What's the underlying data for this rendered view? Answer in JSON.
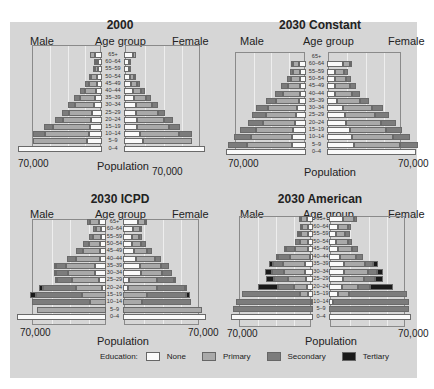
{
  "legend": {
    "title": "Education:",
    "items": [
      {
        "key": "none",
        "label": "None",
        "color": "#fafafa"
      },
      {
        "key": "primary",
        "label": "Primary",
        "color": "#a9a9a9"
      },
      {
        "key": "secondary",
        "label": "Secondary",
        "color": "#7c7c7c"
      },
      {
        "key": "tertiary",
        "label": "Tertiary",
        "color": "#1a1a1a"
      }
    ]
  },
  "age_groups": [
    "65+",
    "60–64",
    "55–59",
    "50–54",
    "45–49",
    "40–44",
    "35–39",
    "30–34",
    "25–29",
    "20–24",
    "15–19",
    "10–14",
    "5–9",
    "0–4"
  ],
  "panels": [
    {
      "title": "2000",
      "male_label": "Male",
      "female_label": "Female",
      "age_label": "Age group",
      "x_label": "Population",
      "left_tick": "70,000",
      "right_tick": "70,000"
    },
    {
      "title": "2030 Constant",
      "male_label": "Male",
      "female_label": "Female",
      "age_label": "Age group",
      "x_label": "Population",
      "left_tick": "70,000",
      "right_tick": "70,000"
    },
    {
      "title": "2030 ICPD",
      "male_label": "Male",
      "female_label": "Female",
      "age_label": "Age group",
      "x_label": "Population",
      "left_tick": "70,000",
      "right_tick": "70,000"
    },
    {
      "title": "2030 American",
      "male_label": "Male",
      "female_label": "Female",
      "age_label": "Age group",
      "x_label": "Population",
      "left_tick": "70,000",
      "right_tick": "70,000"
    }
  ],
  "chart_data": [
    {
      "type": "bar",
      "title": "2000",
      "xlabel": "Population",
      "ylabel": "Age group",
      "xlim": [
        -70000,
        70000
      ],
      "categories": [
        "65+",
        "60–64",
        "55–59",
        "50–54",
        "45–49",
        "40–44",
        "35–39",
        "30–34",
        "25–29",
        "20–24",
        "15–19",
        "10–14",
        "5–9",
        "0–4"
      ],
      "series": [
        {
          "name": "Male None",
          "values": [
            6000,
            3000,
            3000,
            4000,
            4000,
            5000,
            6000,
            7000,
            8000,
            9000,
            10000,
            11000,
            12000,
            69000
          ]
        },
        {
          "name": "Male Primary",
          "values": [
            4000,
            2000,
            3000,
            5000,
            7000,
            9000,
            12000,
            15000,
            19000,
            23000,
            30000,
            36000,
            45000,
            0
          ]
        },
        {
          "name": "Male Secondary",
          "values": [
            0,
            1000,
            1000,
            2000,
            3000,
            4000,
            5000,
            6000,
            6000,
            7000,
            8000,
            10000,
            0,
            0
          ]
        },
        {
          "name": "Male Tertiary",
          "values": [
            0,
            0,
            0,
            0,
            0,
            0,
            0,
            0,
            0,
            0,
            0,
            0,
            0,
            0
          ]
        },
        {
          "name": "Female None",
          "values": [
            7000,
            4000,
            4000,
            5000,
            6000,
            7000,
            8000,
            10000,
            10000,
            11000,
            11000,
            13000,
            16000,
            67000
          ]
        },
        {
          "name": "Female Primary",
          "values": [
            3000,
            1000,
            2000,
            3000,
            5000,
            7000,
            10000,
            13000,
            18000,
            22000,
            26000,
            32000,
            40000,
            0
          ]
        },
        {
          "name": "Female Secondary",
          "values": [
            0,
            0,
            0,
            1000,
            2000,
            3000,
            4000,
            5000,
            6000,
            7000,
            9000,
            11000,
            0,
            0
          ]
        },
        {
          "name": "Female Tertiary",
          "values": [
            0,
            0,
            0,
            0,
            0,
            0,
            0,
            0,
            0,
            0,
            0,
            0,
            0,
            0
          ]
        }
      ],
      "legend": [
        "None",
        "Primary",
        "Secondary",
        "Tertiary"
      ],
      "grid": true
    },
    {
      "type": "bar",
      "title": "2030 Constant",
      "xlabel": "Population",
      "ylabel": "Age group",
      "xlim": [
        -70000,
        70000
      ],
      "categories": [
        "65+",
        "60–64",
        "55–59",
        "50–54",
        "45–49",
        "40–44",
        "35–39",
        "30–34",
        "25–29",
        "20–24",
        "15–19",
        "10–14",
        "5–9",
        "0–4"
      ],
      "series": [
        {
          "name": "Male None",
          "values": [
            0,
            6000,
            5000,
            5000,
            5000,
            5000,
            6000,
            8000,
            9000,
            10000,
            11000,
            12000,
            12000,
            70000
          ]
        },
        {
          "name": "Male Primary",
          "values": [
            0,
            5000,
            6000,
            8000,
            11000,
            15000,
            20000,
            25000,
            26000,
            28000,
            33000,
            36000,
            40000,
            0
          ]
        },
        {
          "name": "Male Secondary",
          "values": [
            0,
            2000,
            3000,
            4000,
            6000,
            7000,
            9000,
            11000,
            12000,
            13000,
            14000,
            15000,
            16000,
            0
          ]
        },
        {
          "name": "Male Tertiary",
          "values": [
            0,
            0,
            0,
            0,
            0,
            0,
            0,
            0,
            0,
            0,
            0,
            0,
            0,
            0
          ]
        },
        {
          "name": "Female None",
          "values": [
            0,
            14000,
            7000,
            7000,
            7000,
            7000,
            9000,
            14000,
            16000,
            17000,
            20000,
            22000,
            24000,
            78000
          ]
        },
        {
          "name": "Female Primary",
          "values": [
            0,
            6000,
            8000,
            10000,
            13000,
            15000,
            20000,
            25000,
            26000,
            30000,
            32000,
            36000,
            40000,
            0
          ]
        },
        {
          "name": "Female Secondary",
          "values": [
            0,
            2000,
            3000,
            4000,
            5000,
            7000,
            8000,
            10000,
            12000,
            13000,
            14000,
            15000,
            16000,
            0
          ]
        },
        {
          "name": "Female Tertiary",
          "values": [
            0,
            0,
            0,
            0,
            0,
            0,
            0,
            0,
            0,
            0,
            0,
            0,
            0,
            0
          ]
        }
      ],
      "legend": [
        "None",
        "Primary",
        "Secondary",
        "Tertiary"
      ],
      "grid": true
    },
    {
      "type": "bar",
      "title": "2030 ICPD",
      "xlabel": "Population",
      "ylabel": "Age group",
      "xlim": [
        -70000,
        70000
      ],
      "categories": [
        "65+",
        "60–64",
        "55–59",
        "50–54",
        "45–49",
        "40–44",
        "35–39",
        "30–34",
        "25–29",
        "20–24",
        "15–19",
        "10–14",
        "5–9",
        "0–4"
      ],
      "series": [
        {
          "name": "Male None",
          "values": [
            6000,
            4000,
            4000,
            5000,
            5000,
            5000,
            9000,
            9000,
            6000,
            3000,
            0,
            0,
            0,
            73000
          ]
        },
        {
          "name": "Male Primary",
          "values": [
            7000,
            4000,
            7000,
            9000,
            14000,
            20000,
            24000,
            22000,
            22000,
            22000,
            20000,
            13000,
            57000,
            0
          ]
        },
        {
          "name": "Male Secondary",
          "values": [
            3000,
            3000,
            3000,
            5000,
            6000,
            7000,
            8000,
            10000,
            12000,
            27000,
            38000,
            48000,
            0,
            0
          ]
        },
        {
          "name": "Male Tertiary",
          "values": [
            0,
            0,
            0,
            0,
            0,
            0,
            1000,
            1000,
            2000,
            3000,
            5000,
            0,
            0,
            0
          ]
        },
        {
          "name": "Female None",
          "values": [
            12000,
            8000,
            7000,
            7000,
            9000,
            11000,
            14000,
            15000,
            5000,
            4000,
            0,
            0,
            0,
            68000
          ]
        },
        {
          "name": "Female Primary",
          "values": [
            6000,
            6000,
            6000,
            8000,
            11000,
            15000,
            17000,
            17000,
            23000,
            24000,
            20000,
            16000,
            65000,
            0
          ]
        },
        {
          "name": "Female Secondary",
          "values": [
            2000,
            2000,
            3000,
            4000,
            4000,
            5000,
            7000,
            8000,
            14000,
            23000,
            32000,
            40000,
            0,
            0
          ]
        },
        {
          "name": "Female Tertiary",
          "values": [
            0,
            0,
            0,
            0,
            0,
            0,
            0,
            0,
            1000,
            2000,
            3000,
            0,
            0,
            0
          ]
        }
      ],
      "legend": [
        "None",
        "Primary",
        "Secondary",
        "Tertiary"
      ],
      "grid": true
    },
    {
      "type": "bar",
      "title": "2030 American",
      "xlabel": "Population",
      "ylabel": "Age group",
      "xlim": [
        -70000,
        70000
      ],
      "categories": [
        "65+",
        "60–64",
        "55–59",
        "50–54",
        "45–49",
        "40–44",
        "35–39",
        "30–34",
        "25–29",
        "20–24",
        "15–19",
        "10–14",
        "5–9",
        "0–4"
      ],
      "series": [
        {
          "name": "Male None",
          "values": [
            5000,
            4000,
            4000,
            4000,
            4000,
            3000,
            7000,
            7000,
            6000,
            5000,
            4000,
            2000,
            0,
            70000
          ]
        },
        {
          "name": "Male Primary",
          "values": [
            5000,
            5000,
            6000,
            7000,
            11000,
            17000,
            19000,
            18000,
            15000,
            11000,
            7000,
            0,
            0,
            0
          ]
        },
        {
          "name": "Male Secondary",
          "values": [
            2000,
            2000,
            2000,
            4000,
            8000,
            10000,
            8000,
            10000,
            12000,
            14000,
            50000,
            64000,
            68000,
            0
          ]
        },
        {
          "name": "Male Tertiary",
          "values": [
            0,
            0,
            1000,
            0,
            1000,
            2000,
            4000,
            6000,
            7000,
            17000,
            0,
            0,
            0,
            0
          ]
        },
        {
          "name": "Female None",
          "values": [
            12000,
            8000,
            6000,
            6000,
            8000,
            9000,
            13000,
            13000,
            12000,
            11000,
            8000,
            3000,
            0,
            70000
          ]
        },
        {
          "name": "Female Primary",
          "values": [
            9000,
            8000,
            8000,
            10000,
            12000,
            14000,
            18000,
            20000,
            18000,
            14000,
            9000,
            0,
            0,
            0
          ]
        },
        {
          "name": "Female Secondary",
          "values": [
            3000,
            3000,
            4000,
            4000,
            5000,
            6000,
            7000,
            8000,
            9000,
            10000,
            50000,
            65000,
            68000,
            0
          ]
        },
        {
          "name": "Female Tertiary",
          "values": [
            0,
            0,
            0,
            0,
            0,
            0,
            4000,
            5000,
            7000,
            20000,
            0,
            0,
            0,
            0
          ]
        }
      ],
      "legend": [
        "None",
        "Primary",
        "Secondary",
        "Tertiary"
      ],
      "grid": true
    }
  ]
}
